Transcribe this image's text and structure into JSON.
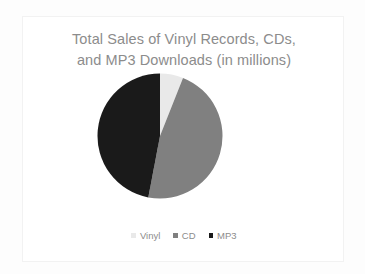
{
  "card": {
    "background": "#ffffff",
    "border_color": "#f2f2f2"
  },
  "chart_data": {
    "type": "pie",
    "title": "Total Sales of Vinyl Records, CDs,\nand MP3 Downloads (in millions)",
    "title_color": "#8c8c8c",
    "xlabel": "",
    "ylabel": "",
    "grid": false,
    "legend_position": "bottom",
    "categories": [
      "Vinyl",
      "CD",
      "MP3"
    ],
    "values": [
      6,
      47,
      47
    ],
    "units": "millions",
    "slices": [
      {
        "label": "Vinyl",
        "value": 6,
        "percent": 6,
        "color": "#e9e9e9",
        "start_angle_deg": 0,
        "end_angle_deg": 21.6
      },
      {
        "label": "CD",
        "value": 47,
        "percent": 47,
        "color": "#808080",
        "start_angle_deg": 21.6,
        "end_angle_deg": 190.8
      },
      {
        "label": "MP3",
        "value": 47,
        "percent": 47,
        "color": "#1a1a1a",
        "start_angle_deg": 190.8,
        "end_angle_deg": 360
      }
    ],
    "legend": [
      {
        "label": "Vinyl",
        "color": "#e9e9e9"
      },
      {
        "label": "CD",
        "color": "#808080"
      },
      {
        "label": "MP3",
        "color": "#1a1a1a"
      }
    ]
  }
}
